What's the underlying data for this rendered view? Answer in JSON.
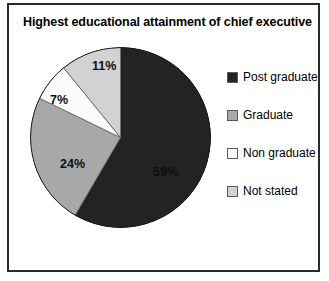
{
  "chart_data": {
    "type": "pie",
    "title": "Highest educational attainment of chief executive",
    "categories": [
      "Post graduate",
      "Graduate",
      "Non graduate",
      "Not stated"
    ],
    "values": [
      59,
      24,
      7,
      11
    ],
    "value_labels": [
      "59%",
      "24%",
      "7%",
      "11%"
    ],
    "unit": "%",
    "colors": [
      "#232323",
      "#a8a8a8",
      "#fbfbfb",
      "#d2d2d2"
    ],
    "legend_position": "right",
    "start_angle_deg": 0,
    "direction": "clockwise",
    "grid": false,
    "xlabel": "",
    "ylabel": ""
  },
  "legend": {
    "items": [
      {
        "label": "Post graduate",
        "color": "#232323"
      },
      {
        "label": "Graduate",
        "color": "#a8a8a8"
      },
      {
        "label": "Non graduate",
        "color": "#fbfbfb"
      },
      {
        "label": "Not stated",
        "color": "#d2d2d2"
      }
    ]
  }
}
